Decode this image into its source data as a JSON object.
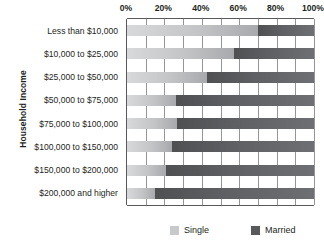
{
  "chart_data": {
    "type": "bar",
    "subtype": "100% stacked horizontal bar",
    "title": "",
    "xlabel": "",
    "ylabel": "Household Income",
    "xlim": [
      0,
      100
    ],
    "xticks": [
      0,
      20,
      40,
      60,
      80,
      100
    ],
    "xtick_labels": [
      "0%",
      "20%",
      "40%",
      "60%",
      "80%",
      "100%"
    ],
    "grid": true,
    "grid_axis": "x",
    "legend_position": "bottom",
    "orientation": "horizontal",
    "categories": [
      "Less than $10,000",
      "$10,000 to $25,000",
      "$25,000 to $50,000",
      "$50,000 to $75,000",
      "$75,000 to $100,000",
      "$100,000 to $150,000",
      "$150,000 to $200,000",
      "$200,000 and higher"
    ],
    "series": [
      {
        "name": "Single",
        "color": "#c8c9cb",
        "values": [
          70,
          57,
          43,
          26,
          27,
          24,
          21,
          15
        ]
      },
      {
        "name": "Married",
        "color": "#58595b",
        "values": [
          30,
          43,
          57,
          74,
          73,
          76,
          79,
          85
        ]
      }
    ]
  },
  "axes": {
    "y_title": "Household Income"
  },
  "legend": {
    "items": [
      {
        "label": "Single",
        "color": "#c8c9cb"
      },
      {
        "label": "Married",
        "color": "#58595b"
      }
    ]
  }
}
